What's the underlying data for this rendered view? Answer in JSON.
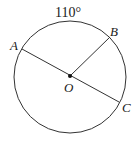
{
  "diagram": {
    "type": "circle-geometry",
    "arc_label": "110°",
    "center": {
      "label": "O",
      "x": 70,
      "y": 76
    },
    "radius": 56,
    "points": [
      {
        "label": "A",
        "x": 22,
        "y": 49
      },
      {
        "label": "B",
        "x": 109,
        "y": 37
      },
      {
        "label": "C",
        "x": 119,
        "y": 101
      }
    ],
    "segments": [
      {
        "from": "A",
        "to": "C",
        "description": "diameter through O"
      },
      {
        "from": "O",
        "to": "B",
        "description": "radius"
      }
    ],
    "colors": {
      "stroke": "#333333",
      "text": "#1a1a1a"
    }
  }
}
